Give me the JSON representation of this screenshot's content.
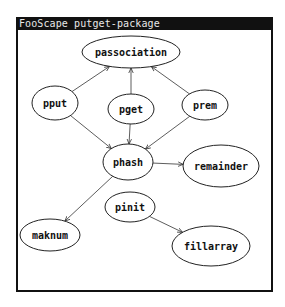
{
  "window": {
    "title": "FooScape putget-package"
  },
  "graph": {
    "nodes": [
      {
        "id": "passociation",
        "label": "passociation",
        "cx": 131,
        "cy": 52,
        "rx": 49,
        "ry": 16
      },
      {
        "id": "pput",
        "label": "pput",
        "cx": 55,
        "cy": 103,
        "rx": 23,
        "ry": 17
      },
      {
        "id": "pget",
        "label": "pget",
        "cx": 131,
        "cy": 109,
        "rx": 23,
        "ry": 15
      },
      {
        "id": "prem",
        "label": "prem",
        "cx": 205,
        "cy": 105,
        "rx": 23,
        "ry": 15
      },
      {
        "id": "phash",
        "label": "phash",
        "cx": 128,
        "cy": 162,
        "rx": 25,
        "ry": 18
      },
      {
        "id": "remainder",
        "label": "remainder",
        "cx": 221,
        "cy": 166,
        "rx": 38,
        "ry": 21
      },
      {
        "id": "maknum",
        "label": "maknum",
        "cx": 50,
        "cy": 235,
        "rx": 30,
        "ry": 16
      },
      {
        "id": "pinit",
        "label": "pinit",
        "cx": 130,
        "cy": 207,
        "rx": 25,
        "ry": 15
      },
      {
        "id": "fillarray",
        "label": "fillarray",
        "cx": 211,
        "cy": 246,
        "rx": 39,
        "ry": 20
      }
    ],
    "edges": [
      {
        "from": "pput",
        "to": "passociation"
      },
      {
        "from": "pget",
        "to": "passociation"
      },
      {
        "from": "prem",
        "to": "passociation"
      },
      {
        "from": "pput",
        "to": "phash"
      },
      {
        "from": "pget",
        "to": "phash"
      },
      {
        "from": "prem",
        "to": "phash"
      },
      {
        "from": "phash",
        "to": "remainder"
      },
      {
        "from": "phash",
        "to": "maknum"
      },
      {
        "from": "pinit",
        "to": "fillarray"
      }
    ]
  }
}
